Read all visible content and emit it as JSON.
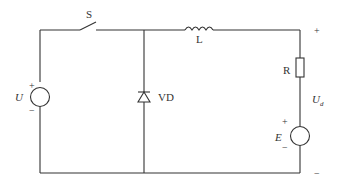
{
  "diagram": {
    "type": "circuit",
    "components": {
      "switch": {
        "label": "S"
      },
      "inductor": {
        "label": "L"
      },
      "diode": {
        "label": "VD"
      },
      "resistor": {
        "label": "R"
      },
      "source_input": {
        "label": "U",
        "plus": "+",
        "minus": "−"
      },
      "source_load": {
        "label": "E",
        "plus": "+",
        "minus": "−"
      }
    },
    "output_voltage": {
      "label_main": "U",
      "label_sub": "d",
      "plus": "+",
      "minus": "−"
    }
  }
}
